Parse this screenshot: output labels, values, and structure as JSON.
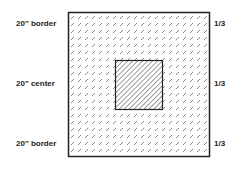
{
  "left_labels": [
    "20\" border",
    "20\" center",
    "20\" border"
  ],
  "right_labels": [
    "1/3",
    "1/3",
    "1/3"
  ],
  "colors": {
    "stroke": "#222222",
    "background": "#ffffff"
  }
}
